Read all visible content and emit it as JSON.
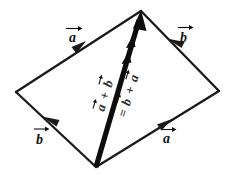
{
  "figure": {
    "background_color": "#ffffff",
    "ink_color": "#111111",
    "sides": {
      "top_left_label": "a",
      "top_right_label": "b",
      "bottom_left_label": "b",
      "bottom_right_label": "a"
    },
    "diagonal": {
      "left_label": "a + b",
      "left_terms": [
        "a",
        "+",
        "b"
      ],
      "right_label": "= b + a",
      "right_terms": [
        "=",
        "b",
        "+",
        "a"
      ]
    },
    "vertices": {
      "left": "16,92",
      "top": "141,11",
      "right": "219,91",
      "bottom": "96,167"
    }
  }
}
